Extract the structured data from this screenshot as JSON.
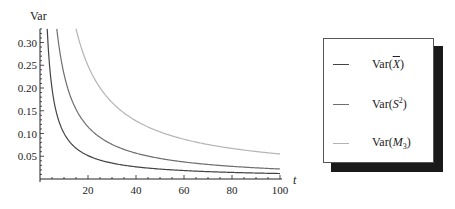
{
  "chart_data": {
    "type": "line",
    "title": "",
    "xlabel": "t",
    "ylabel": "Var",
    "xlim": [
      0,
      100
    ],
    "ylim": [
      0,
      0.33
    ],
    "x_ticks": [
      20,
      40,
      60,
      80,
      100
    ],
    "x_tick_labels": [
      "20",
      "40",
      "60",
      "80",
      "100"
    ],
    "y_ticks": [
      0.05,
      0.1,
      0.15,
      0.2,
      0.25,
      0.3
    ],
    "y_tick_labels": [
      "0.05",
      "0.10",
      "0.15",
      "0.20",
      "0.25",
      "0.30"
    ],
    "grid": false,
    "legend_position": "right, outside, boxed with drop shadow",
    "x": [
      3,
      5,
      7,
      10,
      15,
      20,
      30,
      40,
      50,
      60,
      70,
      80,
      90,
      100
    ],
    "series": [
      {
        "name": "Var(X̄)",
        "color": "#444444",
        "values": [
          0.33,
          0.21,
          0.15,
          0.11,
          0.072,
          0.055,
          0.037,
          0.028,
          0.022,
          0.019,
          0.016,
          0.014,
          0.013,
          0.012
        ]
      },
      {
        "name": "Var(S²)",
        "color": "#6e6e6e",
        "values": [
          null,
          null,
          0.33,
          0.23,
          0.15,
          0.11,
          0.075,
          0.056,
          0.045,
          0.037,
          0.032,
          0.028,
          0.025,
          0.022
        ]
      },
      {
        "name": "Var(M₃)",
        "color": "#b4b4b4",
        "values": [
          null,
          null,
          null,
          null,
          0.33,
          0.26,
          0.18,
          0.135,
          0.108,
          0.09,
          0.077,
          0.068,
          0.06,
          0.055
        ]
      }
    ]
  },
  "legend": {
    "items": [
      {
        "prefix": "Var(",
        "symbol": "X",
        "overline": true,
        "sup": "",
        "sub": "",
        "suffix": ")"
      },
      {
        "prefix": "Var(",
        "symbol": "S",
        "overline": false,
        "sup": "2",
        "sub": "",
        "suffix": ")"
      },
      {
        "prefix": "Var(",
        "symbol": "M",
        "overline": false,
        "sup": "",
        "sub": "3",
        "suffix": ")"
      }
    ]
  }
}
